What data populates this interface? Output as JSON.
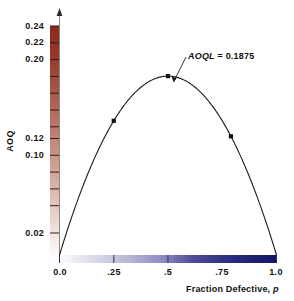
{
  "chart_data": {
    "type": "line",
    "title": "",
    "xlabel": "Fraction Defective, p",
    "ylabel": "AOQ",
    "xlim": [
      0.0,
      1.0
    ],
    "ylim": [
      0.0,
      0.25
    ],
    "grid": false,
    "legend": null,
    "x_tick_labels": [
      "0.0",
      ".25",
      ".5",
      ".75",
      "1.0"
    ],
    "x_tick_values": [
      0.0,
      0.25,
      0.5,
      0.75,
      1.0
    ],
    "y_tick_labels": [
      "0.24",
      "0.22",
      "0.20",
      "0.12",
      "0.10",
      "0.02"
    ],
    "y_tick_values": [
      0.24,
      0.22,
      0.2,
      0.12,
      0.1,
      0.02
    ],
    "y_minor_tick_values": [
      0.04,
      0.06,
      0.08,
      0.14,
      0.16,
      0.18
    ],
    "series": [
      {
        "name": "AOQ curve",
        "x": [
          0.0,
          0.05,
          0.1,
          0.15,
          0.2,
          0.25,
          0.3,
          0.35,
          0.4,
          0.45,
          0.5,
          0.55,
          0.6,
          0.65,
          0.7,
          0.75,
          0.8,
          0.85,
          0.9,
          0.95,
          1.0
        ],
        "y": [
          0.0,
          0.0356,
          0.0675,
          0.0956,
          0.12,
          0.1406,
          0.1575,
          0.1706,
          0.18,
          0.1856,
          0.1875,
          0.1856,
          0.18,
          0.1706,
          0.1575,
          0.1406,
          0.12,
          0.0956,
          0.0675,
          0.0356,
          0.0
        ]
      }
    ],
    "markers": [
      {
        "x": 0.25,
        "y": 0.1406
      },
      {
        "x": 0.5,
        "y": 0.1875
      },
      {
        "x": 0.79,
        "y": 0.1244
      }
    ],
    "annotations": [
      {
        "label_prefix": "AOQL",
        "label_rest": " = 0.1875",
        "text": "AOQL = 0.1875",
        "points_to_x": 0.5,
        "points_to_y": 0.1875
      }
    ],
    "colorbars": [
      {
        "name": "y-axis-colorbar",
        "orientation": "vertical",
        "from_color": "#ffffff",
        "to_color": "#8e2a20"
      },
      {
        "name": "x-axis-colorbar",
        "orientation": "horizontal",
        "from_color": "#ffffff",
        "to_color": "#151a6e"
      }
    ]
  },
  "axes": {
    "y_title": "AOQ",
    "x_title_main": "Fraction Defective,",
    "x_title_italic": "p"
  },
  "annotation": {
    "italic_part": "AOQL",
    "plain_part": " = 0.1875"
  },
  "ticks": {
    "y": [
      {
        "label": "0.24",
        "top": 21
      },
      {
        "label": "0.22",
        "top": 37
      },
      {
        "label": "0.20",
        "top": 54
      },
      {
        "label": "0.12",
        "top": 133
      },
      {
        "label": "0.10",
        "top": 150
      },
      {
        "label": "0.02",
        "top": 228
      }
    ],
    "x": [
      {
        "label": "0.0",
        "left": 43
      },
      {
        "label": ".25",
        "left": 97
      },
      {
        "label": ".5",
        "left": 151
      },
      {
        "label": ".75",
        "left": 205
      },
      {
        "label": "1.0",
        "left": 259
      }
    ]
  }
}
